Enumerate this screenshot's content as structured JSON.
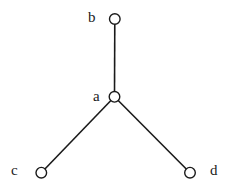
{
  "diagram": {
    "type": "tree-graph",
    "canvas": {
      "width": 229,
      "height": 188
    },
    "colors": {
      "stroke": "#1a1a1a",
      "node_fill": "#ffffff",
      "background": "#ffffff"
    },
    "node_radius": 5.3,
    "nodes": [
      {
        "id": "a",
        "label": "a",
        "x": 114.5,
        "y": 96.8,
        "label_x": 93,
        "label_y": 101
      },
      {
        "id": "b",
        "label": "b",
        "x": 114.8,
        "y": 19.0,
        "label_x": 88,
        "label_y": 22
      },
      {
        "id": "c",
        "label": "c",
        "x": 41.3,
        "y": 172.7,
        "label_x": 11,
        "label_y": 175
      },
      {
        "id": "d",
        "label": "d",
        "x": 190.0,
        "y": 172.7,
        "label_x": 210,
        "label_y": 175
      }
    ],
    "edges": [
      {
        "from": "a",
        "to": "b"
      },
      {
        "from": "a",
        "to": "c"
      },
      {
        "from": "a",
        "to": "d"
      }
    ]
  }
}
